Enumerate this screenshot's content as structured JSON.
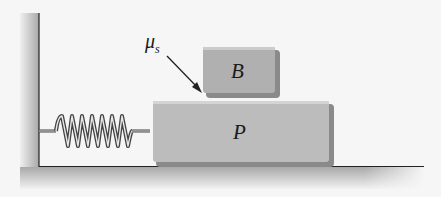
{
  "diagram": {
    "labels": {
      "friction": "μ",
      "friction_sub": "s",
      "top_block": "B",
      "bottom_block": "P"
    },
    "colors": {
      "background": "#f6f6f6",
      "block_fill": "#bcbcbc",
      "block_shadow": "#8a8a8a",
      "wall": "#c8c8c8",
      "line": "#222222"
    }
  }
}
